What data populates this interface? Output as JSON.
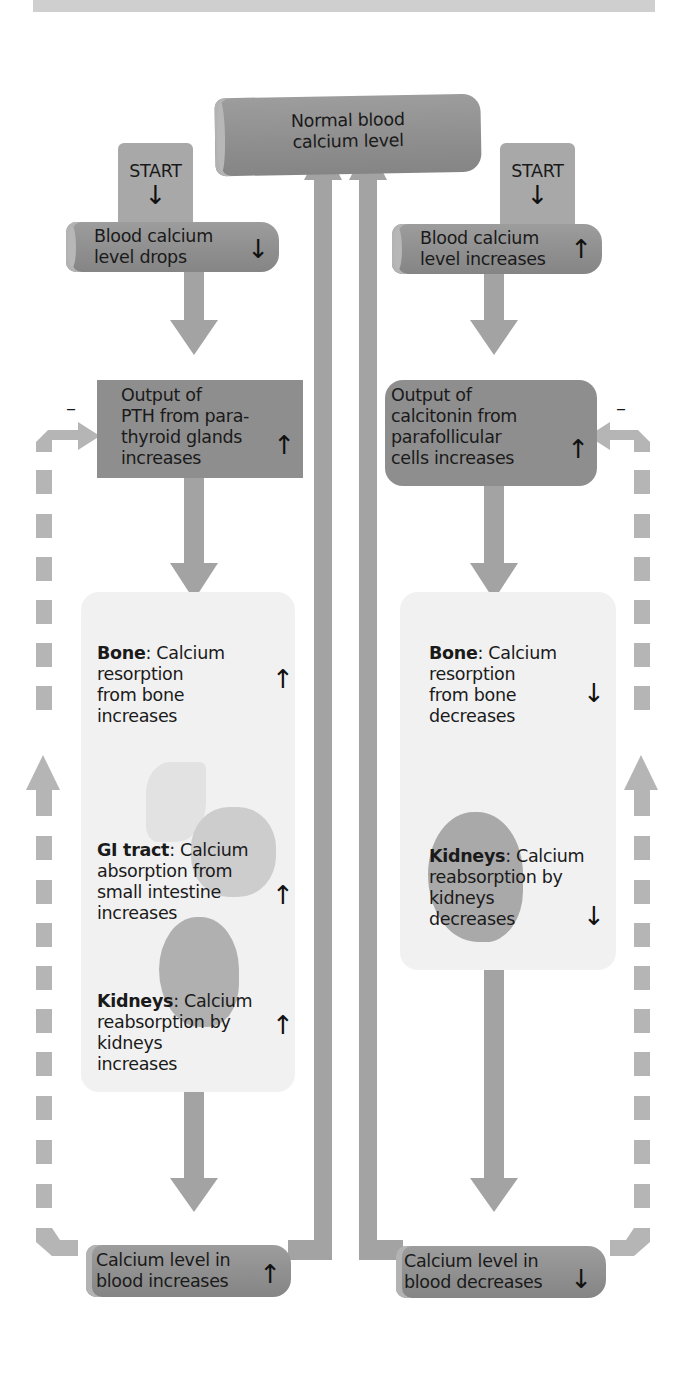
{
  "top_center": {
    "label_line1": "Normal blood",
    "label_line2": "calcium level"
  },
  "left": {
    "start": {
      "label": "START",
      "arrow": "↓"
    },
    "trigger": {
      "line1": "Blood calcium",
      "line2": "level drops",
      "arrow": "↓"
    },
    "gland": {
      "line1": "Output of",
      "line2": "PTH from para-",
      "line3": "thyroid glands",
      "line4": "increases",
      "arrow": "↑"
    },
    "feedback_sign": "–",
    "effects": [
      {
        "organ": "Bone",
        "line1": ": Calcium",
        "line2": "resorption",
        "line3": "from bone",
        "line4": "increases",
        "arrow": "↑"
      },
      {
        "organ": "GI tract",
        "line1": ": Calcium",
        "line2": "absorption from",
        "line3": "small intestine",
        "line4": "increases",
        "arrow": "↑"
      },
      {
        "organ": "Kidneys",
        "line1": ": Calcium",
        "line2": "reabsorption by",
        "line3": "kidneys",
        "line4": "increases",
        "arrow": "↑"
      }
    ],
    "result": {
      "line1": "Calcium level in",
      "line2": "blood increases",
      "arrow": "↑"
    }
  },
  "right": {
    "start": {
      "label": "START",
      "arrow": "↓"
    },
    "trigger": {
      "line1": "Blood calcium",
      "line2": "level increases",
      "arrow": "↑"
    },
    "gland": {
      "line1": "Output of",
      "line2": "calcitonin from",
      "line3": "parafollicular",
      "line4": "cells increases",
      "arrow": "↑"
    },
    "feedback_sign": "–",
    "effects": [
      {
        "organ": "Bone",
        "line1": ": Calcium",
        "line2": "resorption",
        "line3": "from bone",
        "line4": "decreases",
        "arrow": "↓"
      },
      {
        "organ": "Kidneys",
        "line1": ": Calcium",
        "line2": "reabsorption by",
        "line3": "kidneys",
        "line4": "decreases",
        "arrow": "↓"
      }
    ],
    "result": {
      "line1": "Calcium level in",
      "line2": "blood decreases",
      "arrow": "↓"
    }
  },
  "colors": {
    "arrow_gray": "#a3a3a3",
    "dashed_gray": "#b5b5b5",
    "box_dark": "#8e8e8e",
    "panel_light": "#f1f1f1"
  }
}
